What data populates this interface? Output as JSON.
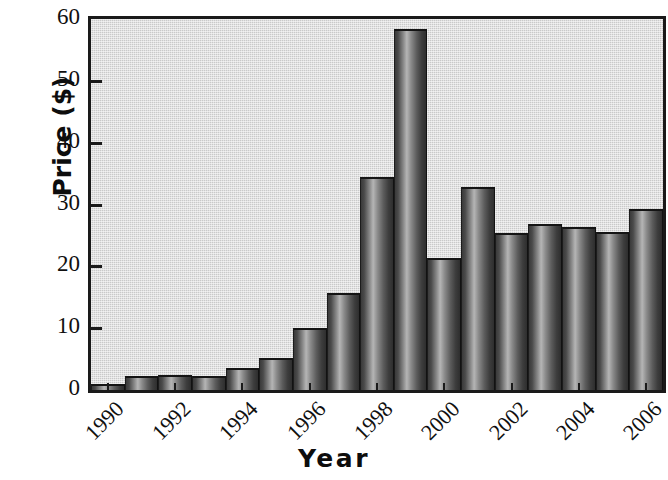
{
  "chart_data": {
    "type": "bar",
    "title": "",
    "subtitle": "",
    "xlabel": "Year",
    "ylabel": "Price ($)",
    "categories": [
      1990,
      1991,
      1992,
      1993,
      1994,
      1995,
      1996,
      1997,
      1998,
      1999,
      2000,
      2001,
      2002,
      2003,
      2004,
      2005,
      2006
    ],
    "values": [
      1.0,
      2.3,
      2.5,
      2.2,
      3.6,
      5.2,
      10.0,
      15.7,
      34.4,
      58.4,
      21.3,
      32.8,
      25.4,
      26.8,
      26.3,
      25.6,
      29.2
    ],
    "series": [
      {
        "name": "Price",
        "values": [
          1.0,
          2.3,
          2.5,
          2.2,
          3.6,
          5.2,
          10.0,
          15.7,
          34.4,
          58.4,
          21.3,
          32.8,
          25.4,
          26.8,
          26.3,
          25.6,
          29.2
        ]
      }
    ],
    "ylim": [
      0,
      60
    ],
    "ytick_labels": [
      "0",
      "10",
      "20",
      "30",
      "40",
      "50",
      "60"
    ],
    "ytick_values": [
      0,
      10,
      20,
      30,
      40,
      50,
      60
    ],
    "xtick_labels": [
      "1990",
      "1992",
      "1994",
      "1996",
      "1998",
      "2000",
      "2002",
      "2004",
      "2006"
    ],
    "xtick_values": [
      1990,
      1992,
      1994,
      1996,
      1998,
      2000,
      2002,
      2004,
      2006
    ],
    "xlim": [
      1989.5,
      2006.5
    ],
    "grid": false,
    "legend": false,
    "legend_position": "none",
    "plot_background_color": "#c9c9c9",
    "bar_color": "#6f6f6f",
    "axis_color": "#1a1a1a",
    "text_color": "#101010",
    "xtick_rotation": -45
  }
}
